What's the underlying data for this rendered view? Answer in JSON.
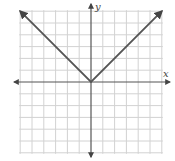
{
  "chart_data": {
    "type": "line",
    "title": "",
    "function": "y = |x|",
    "xlabel": "x",
    "ylabel": "y",
    "xlim": [
      -6,
      6
    ],
    "ylim": [
      -6,
      6
    ],
    "grid": true,
    "grid_step": 1,
    "tick_labels": [],
    "series": [
      {
        "name": "y = |x|",
        "x": [
          -6,
          0,
          6
        ],
        "y": [
          6,
          0,
          6
        ],
        "arrows": [
          "start",
          "end"
        ]
      }
    ],
    "colors": {
      "grid": "#d2d2d2",
      "axis": "#555555",
      "curve": "#555555"
    }
  }
}
